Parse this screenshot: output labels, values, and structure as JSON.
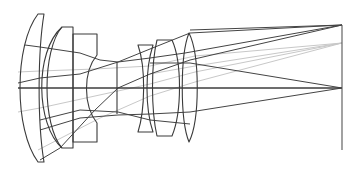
{
  "diagram": {
    "type": "optical-lens-layout",
    "colors": {
      "lens_outline": "#3a3a3a",
      "ray_dark": "#444444",
      "ray_light": "#c8c8c8",
      "background": "#ffffff"
    },
    "optical_axis_y": 88,
    "image_plane": {
      "x": 342,
      "y_top": 25,
      "y_bottom": 150
    },
    "elements": [
      {
        "id": "lens-1",
        "kind": "negative-meniscus"
      },
      {
        "id": "lens-2",
        "kind": "meniscus"
      },
      {
        "id": "lens-3",
        "kind": "cemented-negative"
      },
      {
        "id": "aperture-stop",
        "kind": "stop"
      },
      {
        "id": "lens-4",
        "kind": "negative"
      },
      {
        "id": "lens-5",
        "kind": "positive"
      },
      {
        "id": "lens-6",
        "kind": "biconvex-positive"
      }
    ],
    "field_points": [
      {
        "name": "on-axis",
        "image_y": 88
      },
      {
        "name": "mid-field",
        "image_y": 43
      },
      {
        "name": "full-field",
        "image_y": 25
      }
    ]
  }
}
